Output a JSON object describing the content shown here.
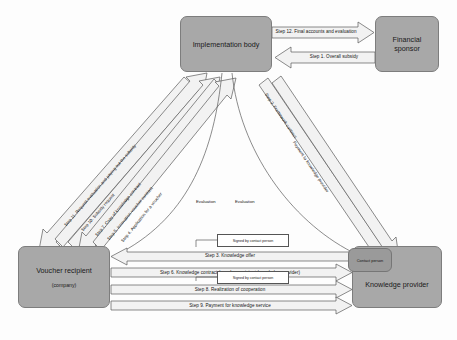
{
  "diagram": {
    "colors": {
      "node_fill": "#a8a8a8",
      "node_stroke": "#7d7d7d",
      "arrow_fill": "#f2f2f2",
      "arrow_stroke": "#5a5a5a",
      "background": "#fdfdfd",
      "text": "#141414"
    }
  },
  "nodes": {
    "implementation_body": {
      "label": "Implementation body"
    },
    "financial_sponsor": {
      "label_line1": "Financial",
      "label_line2": "sponsor"
    },
    "voucher_recipient": {
      "label": "Voucher recipient",
      "sublabel": "(company)"
    },
    "knowledge_provider": {
      "label": "Knowledge provider"
    },
    "contact_person_badge": {
      "label": "Contact person"
    }
  },
  "top_arrows": [
    {
      "id": "step12",
      "label": "Step 12.  Final accounts and evaluation",
      "from": "implementation_body",
      "to": "financial_sponsor"
    },
    {
      "id": "step1",
      "label": "Step 1. Overall subsidy",
      "from": "financial_sponsor",
      "to": "implementation_body"
    }
  ],
  "left_diagonal_arrows": [
    {
      "id": "step11",
      "label": "Step 11. Request evaluation and paying out the subsidy",
      "from": "implementation_body",
      "to": "voucher_recipient"
    },
    {
      "id": "step10",
      "label": "Step 10. Subsidy request",
      "from": "voucher_recipient",
      "to": "implementation_body"
    },
    {
      "id": "step7",
      "label": "Step 7. Copy of knowledge contract",
      "from": "voucher_recipient",
      "to": "implementation_body"
    },
    {
      "id": "step5",
      "label": "Step 5. Innovation voucher contract",
      "from": "implementation_body",
      "to": "voucher_recipient"
    },
    {
      "id": "step4",
      "label": "Step 4. Application for a voucher",
      "from": "voucher_recipient",
      "to": "implementation_body"
    }
  ],
  "right_diagonal_arrows": [
    {
      "id": "step2",
      "label": "Step 2. Framework contract",
      "from": "implementation_body",
      "to": "knowledge_provider"
    },
    {
      "id": "step10b",
      "label": "Payment to knowledge provider",
      "from": "implementation_body",
      "to": "knowledge_provider"
    }
  ],
  "bottom_arrows": [
    {
      "id": "step3",
      "label": "Step 3. Knowledge offer",
      "from": "knowledge_provider",
      "to": "voucher_recipient"
    },
    {
      "id": "step6",
      "label": "Step 6. Knowledge contract (voucher recipient-knowledge provider)",
      "from": "voucher_recipient",
      "to": "knowledge_provider"
    },
    {
      "id": "step8",
      "label": "Step 8. Realization of cooperation",
      "from": "voucher_recipient",
      "to": "knowledge_provider"
    },
    {
      "id": "step9",
      "label": "Step 9. Payment for knowledge service",
      "from": "voucher_recipient",
      "to": "knowledge_provider"
    }
  ],
  "sign_boxes": [
    {
      "id": "sign_top",
      "label": "Signed by contact person"
    },
    {
      "id": "sign_bottom",
      "label": "Signed by contact person"
    }
  ],
  "evaluation_labels": [
    {
      "id": "eval_left",
      "label": "Evaluation"
    },
    {
      "id": "eval_right",
      "label": "Evaluation"
    }
  ]
}
